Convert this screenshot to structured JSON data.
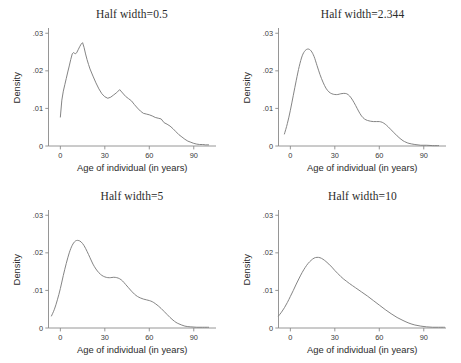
{
  "figure": {
    "name": "kernel-density-panels",
    "xlabel": "Age of individual (in years)",
    "ylabel": "Density",
    "xticks": [
      "0",
      "30",
      "60",
      "90"
    ],
    "xtick_values": [
      0,
      30,
      60,
      90
    ],
    "yticks": [
      ".03",
      ".02",
      ".01",
      "0"
    ],
    "ytick_values": [
      0.03,
      0.02,
      0.01,
      0
    ],
    "xlim": [
      -8,
      105
    ],
    "ylim": [
      0,
      0.031
    ],
    "curve_color": "#7d7d7d",
    "axis_color": "#8a8a8a",
    "background": "#ffffff"
  },
  "chart_data": [
    {
      "type": "line",
      "title": "Half width=0.5",
      "xlabel": "Age of individual (in years)",
      "ylabel": "Density",
      "xlim": [
        -8,
        105
      ],
      "ylim": [
        0,
        0.031
      ],
      "xticks": [
        0,
        30,
        60,
        90
      ],
      "yticks": [
        0,
        0.01,
        0.02,
        0.03
      ],
      "grid": false,
      "legend": "none",
      "x": [
        0,
        1,
        2,
        3,
        4,
        5,
        6,
        7,
        8,
        9,
        10,
        11,
        12,
        13,
        14,
        15,
        16,
        17,
        18,
        19,
        20,
        22,
        24,
        26,
        28,
        30,
        32,
        34,
        36,
        38,
        40,
        42,
        44,
        46,
        48,
        50,
        52,
        54,
        56,
        58,
        60,
        62,
        64,
        66,
        68,
        70,
        72,
        74,
        76,
        78,
        80,
        82,
        84,
        86,
        88,
        90,
        92,
        94,
        96,
        98,
        100
      ],
      "y": [
        0.0077,
        0.0122,
        0.0146,
        0.0163,
        0.018,
        0.0197,
        0.0213,
        0.023,
        0.0245,
        0.0249,
        0.0245,
        0.0248,
        0.0256,
        0.0264,
        0.0271,
        0.0275,
        0.0262,
        0.0245,
        0.023,
        0.0217,
        0.0205,
        0.0186,
        0.0168,
        0.0152,
        0.0139,
        0.0131,
        0.0127,
        0.013,
        0.0136,
        0.0142,
        0.015,
        0.0141,
        0.0132,
        0.0126,
        0.012,
        0.011,
        0.0101,
        0.0093,
        0.0087,
        0.0085,
        0.0083,
        0.008,
        0.0076,
        0.0074,
        0.0072,
        0.0062,
        0.0058,
        0.0053,
        0.0046,
        0.0038,
        0.003,
        0.0024,
        0.0018,
        0.0013,
        0.001,
        0.0007,
        0.0005,
        0.0004,
        0.0004,
        0.0003,
        0.0003
      ]
    },
    {
      "type": "line",
      "title": "Half width=2.344",
      "xlabel": "Age of individual (in years)",
      "ylabel": "Density",
      "xlim": [
        -8,
        105
      ],
      "ylim": [
        0,
        0.031
      ],
      "xticks": [
        0,
        30,
        60,
        90
      ],
      "yticks": [
        0,
        0.01,
        0.02,
        0.03
      ],
      "grid": false,
      "legend": "none",
      "x": [
        -4,
        -2,
        0,
        2,
        4,
        6,
        8,
        10,
        12,
        14,
        16,
        18,
        20,
        22,
        24,
        26,
        28,
        30,
        32,
        34,
        36,
        38,
        40,
        42,
        44,
        46,
        48,
        50,
        52,
        54,
        56,
        58,
        60,
        62,
        64,
        66,
        68,
        70,
        72,
        74,
        76,
        78,
        80,
        84,
        88,
        92,
        96,
        100
      ],
      "y": [
        0.0032,
        0.006,
        0.0095,
        0.0135,
        0.0175,
        0.0212,
        0.024,
        0.0254,
        0.0258,
        0.0253,
        0.0238,
        0.0214,
        0.019,
        0.017,
        0.0154,
        0.0144,
        0.0139,
        0.0137,
        0.0137,
        0.0139,
        0.014,
        0.0139,
        0.0133,
        0.0122,
        0.0108,
        0.0093,
        0.008,
        0.0072,
        0.0068,
        0.0066,
        0.0065,
        0.0065,
        0.0065,
        0.0063,
        0.0058,
        0.0051,
        0.0043,
        0.0035,
        0.0027,
        0.002,
        0.0014,
        0.001,
        0.0007,
        0.0004,
        0.0002,
        0.0002,
        0.0001,
        0.0001
      ]
    },
    {
      "type": "line",
      "title": "Half width=5",
      "xlabel": "Age of individual (in years)",
      "ylabel": "Density",
      "xlim": [
        -8,
        105
      ],
      "ylim": [
        0,
        0.031
      ],
      "xticks": [
        0,
        30,
        60,
        90
      ],
      "yticks": [
        0,
        0.01,
        0.02,
        0.03
      ],
      "grid": false,
      "legend": "none",
      "x": [
        -6,
        -4,
        -2,
        0,
        2,
        4,
        6,
        8,
        10,
        12,
        14,
        16,
        18,
        20,
        22,
        24,
        26,
        28,
        30,
        32,
        34,
        36,
        38,
        40,
        42,
        44,
        46,
        48,
        50,
        52,
        54,
        56,
        58,
        60,
        62,
        64,
        66,
        68,
        70,
        72,
        74,
        76,
        78,
        80,
        84,
        88,
        92,
        96,
        100
      ],
      "y": [
        0.0032,
        0.005,
        0.0075,
        0.0105,
        0.014,
        0.0172,
        0.02,
        0.022,
        0.0231,
        0.0233,
        0.0229,
        0.0219,
        0.0204,
        0.0187,
        0.017,
        0.0157,
        0.0147,
        0.014,
        0.0136,
        0.0134,
        0.0134,
        0.0135,
        0.0134,
        0.0131,
        0.0125,
        0.0116,
        0.0107,
        0.0098,
        0.009,
        0.0084,
        0.008,
        0.0077,
        0.0075,
        0.0073,
        0.007,
        0.0065,
        0.0059,
        0.0052,
        0.0044,
        0.0036,
        0.0028,
        0.0021,
        0.0015,
        0.0011,
        0.0005,
        0.0003,
        0.0002,
        0.0002,
        0.0002
      ]
    },
    {
      "type": "line",
      "title": "Half width=10",
      "xlabel": "Age of individual (in years)",
      "ylabel": "Density",
      "xlim": [
        -8,
        105
      ],
      "ylim": [
        0,
        0.031
      ],
      "xticks": [
        0,
        30,
        60,
        90
      ],
      "yticks": [
        0,
        0.01,
        0.02,
        0.03
      ],
      "grid": false,
      "legend": "none",
      "x": [
        -8,
        -6,
        -4,
        -2,
        0,
        2,
        4,
        6,
        8,
        10,
        12,
        14,
        16,
        18,
        20,
        22,
        24,
        26,
        28,
        30,
        32,
        34,
        36,
        38,
        40,
        44,
        48,
        52,
        56,
        60,
        64,
        68,
        72,
        76,
        80,
        84,
        88,
        92,
        96,
        100,
        104
      ],
      "y": [
        0.0032,
        0.0042,
        0.0054,
        0.0068,
        0.0084,
        0.01,
        0.0117,
        0.0133,
        0.0148,
        0.0161,
        0.0172,
        0.018,
        0.0186,
        0.0188,
        0.0187,
        0.0183,
        0.0177,
        0.017,
        0.0162,
        0.0153,
        0.0145,
        0.0137,
        0.013,
        0.0124,
        0.0118,
        0.0107,
        0.0096,
        0.0085,
        0.0073,
        0.0061,
        0.0049,
        0.0038,
        0.0028,
        0.002,
        0.0013,
        0.0008,
        0.0005,
        0.0003,
        0.0002,
        0.0002,
        0.0002
      ]
    }
  ]
}
